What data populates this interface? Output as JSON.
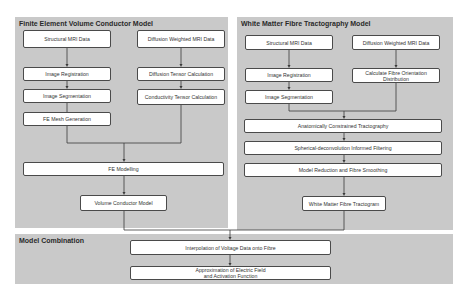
{
  "panels": {
    "fe_model": {
      "title": "Finite Element Volume Conductor Model",
      "boxes": {
        "structural_mri": "Structural MRI Data",
        "diffusion_mri": "Diffusion Weighted  MRI Data",
        "image_registration": "Image Registration",
        "diffusion_tensor": "Diffusion Tensor Calculation",
        "image_segmentation": "Image Segmentation",
        "conductivity_tensor": "Conductivity Tensor Calculation",
        "fe_mesh": "FE Mesh Generation",
        "fe_modelling": "FE Modelling",
        "volume_conductor": "Volume Conductor Model"
      }
    },
    "tractography_model": {
      "title": "White Matter Fibre Tractography Model",
      "boxes": {
        "structural_mri": "Structural MRI Data",
        "diffusion_mri": "Diffusion Weighted  MRI Data",
        "image_registration": "Image Registration",
        "fibre_orientation": "Calculate Fibre Orientation Distribution",
        "image_segmentation": "Image Segmentation",
        "act": "Anatomically Constrained Tractography",
        "sift": "Spherical-deconvolution Informed Filtering",
        "model_reduction": "Model Reduction and Fibre Smoothing",
        "tractogram": "White Matter Fibre Tractogram"
      }
    },
    "combination": {
      "title": "Model Combination",
      "boxes": {
        "interpolation": "Interpolation of Voltage Data onto Fibre",
        "approximation": "Approximation of Electric Field and Activation Function"
      }
    }
  }
}
